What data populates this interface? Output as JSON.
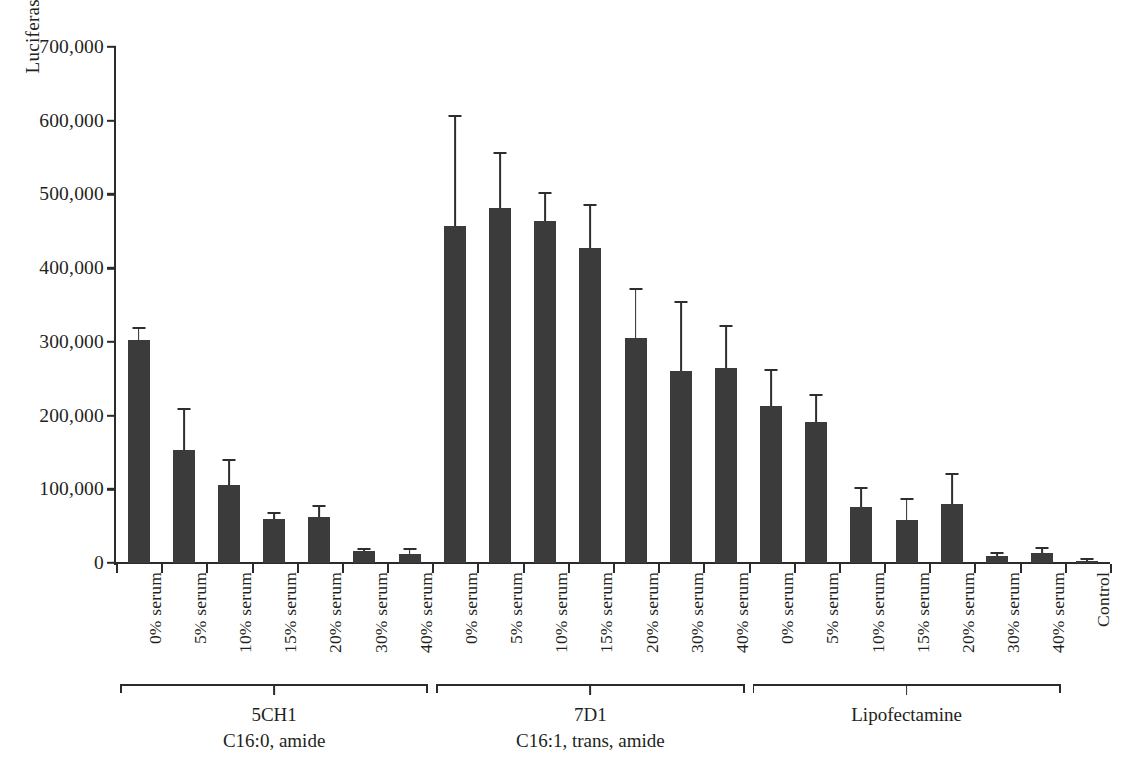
{
  "chart_data": {
    "type": "bar",
    "title": "",
    "xlabel": "",
    "ylabel": "Luciferase (RLU/µg)",
    "ylim": [
      0,
      700000
    ],
    "ytick_labels": [
      "0",
      "100,000",
      "200,000",
      "300,000",
      "400,000",
      "500,000",
      "600,000",
      "700,000"
    ],
    "ytick_values": [
      0,
      100000,
      200000,
      300000,
      400000,
      500000,
      600000,
      700000
    ],
    "grid": false,
    "legend": "none",
    "error_bars": "upper-only",
    "bar_color": "#3b3b3b",
    "axis_color": "#2b2b2b",
    "categories": [
      "0% serum",
      "5% serum",
      "10% serum",
      "15% serum",
      "20% serum",
      "30% serum",
      "40% serum",
      "0% serum",
      "5% serum",
      "10% serum",
      "15% serum",
      "20% serum",
      "30% serum",
      "40% serum",
      "0% serum",
      "5% serum",
      "10% serum",
      "15% serum",
      "20% serum",
      "30% serum",
      "40% serum",
      "Control"
    ],
    "values": [
      302000,
      153000,
      106000,
      60000,
      63000,
      16000,
      12000,
      457000,
      481000,
      464000,
      427000,
      305000,
      261000,
      265000,
      213000,
      191000,
      76000,
      59000,
      80000,
      9000,
      13000,
      3000
    ],
    "errors": [
      16000,
      55000,
      32000,
      7000,
      13000,
      2000,
      6000,
      148000,
      74000,
      36000,
      57000,
      65000,
      92000,
      55000,
      47000,
      35000,
      24000,
      27000,
      40000,
      3000,
      6000,
      1500
    ],
    "groups": [
      {
        "title": "5CH1",
        "subtitle": "C16:0, amide",
        "start": 0,
        "end": 6
      },
      {
        "title": "7D1",
        "subtitle": "C16:1, trans, amide",
        "start": 7,
        "end": 13
      },
      {
        "title": "Lipofectamine",
        "subtitle": "",
        "start": 14,
        "end": 20
      }
    ]
  }
}
